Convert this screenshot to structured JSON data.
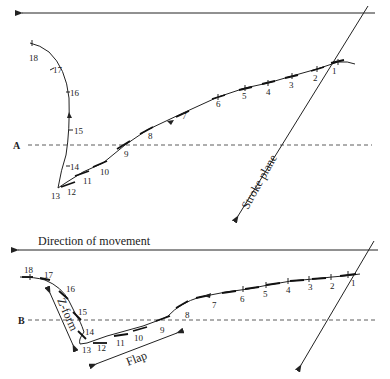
{
  "panel_a": {
    "label": "A",
    "stroke_plane_label": "Stroke plane",
    "points": [
      "1",
      "2",
      "3",
      "4",
      "5",
      "6",
      "7",
      "8",
      "9",
      "10",
      "11",
      "12",
      "13",
      "14",
      "15",
      "16",
      "17",
      "18"
    ]
  },
  "panel_b": {
    "label": "B",
    "direction_label": "Direction of movement",
    "z_form_label": "Z-form",
    "flap_label": "Flap",
    "points": [
      "1",
      "2",
      "3",
      "4",
      "5",
      "6",
      "7",
      "8",
      "9",
      "10",
      "11",
      "12",
      "13",
      "14",
      "15",
      "16",
      "17",
      "18"
    ]
  },
  "colors": {
    "ink": "#222222",
    "background": "#ffffff"
  }
}
